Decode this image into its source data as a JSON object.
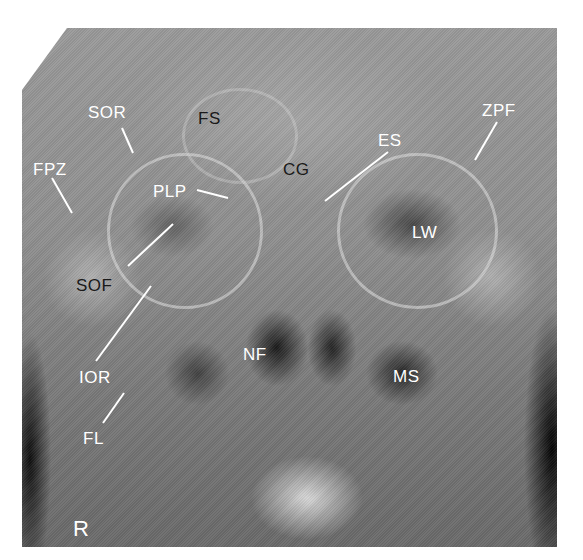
{
  "figure": {
    "type": "radiograph",
    "view": "frontal skull (Caldwell / PA projection)",
    "side_marker": "R"
  },
  "labels": [
    {
      "id": "SOR",
      "text": "SOR",
      "x": 88,
      "y": 104,
      "tone": "light"
    },
    {
      "id": "FS",
      "text": "FS",
      "x": 198,
      "y": 110,
      "tone": "dark"
    },
    {
      "id": "FPZ",
      "text": "FPZ",
      "x": 33,
      "y": 161,
      "tone": "light"
    },
    {
      "id": "CG",
      "text": "CG",
      "x": 283,
      "y": 161,
      "tone": "dark"
    },
    {
      "id": "ES",
      "text": "ES",
      "x": 378,
      "y": 132,
      "tone": "light"
    },
    {
      "id": "ZPF",
      "text": "ZPF",
      "x": 482,
      "y": 102,
      "tone": "light"
    },
    {
      "id": "PLP",
      "text": "PLP",
      "x": 153,
      "y": 183,
      "tone": "light"
    },
    {
      "id": "LW",
      "text": "LW",
      "x": 412,
      "y": 224,
      "tone": "light"
    },
    {
      "id": "SOF",
      "text": "SOF",
      "x": 76,
      "y": 277,
      "tone": "dark"
    },
    {
      "id": "IOR",
      "text": "IOR",
      "x": 79,
      "y": 369,
      "tone": "light"
    },
    {
      "id": "NF",
      "text": "NF",
      "x": 243,
      "y": 346,
      "tone": "light"
    },
    {
      "id": "MS",
      "text": "MS",
      "x": 393,
      "y": 368,
      "tone": "light"
    },
    {
      "id": "FL",
      "text": "FL",
      "x": 83,
      "y": 430,
      "tone": "light"
    }
  ],
  "leader_lines": [
    {
      "for": "SOR",
      "x1": 122,
      "y1": 128,
      "x2": 133,
      "y2": 153
    },
    {
      "for": "FPZ",
      "x1": 52,
      "y1": 178,
      "x2": 72,
      "y2": 213
    },
    {
      "for": "PLP",
      "x1": 197,
      "y1": 190,
      "x2": 228,
      "y2": 198
    },
    {
      "for": "ES",
      "x1": 388,
      "y1": 152,
      "x2": 325,
      "y2": 201
    },
    {
      "for": "ZPF",
      "x1": 497,
      "y1": 122,
      "x2": 475,
      "y2": 160
    },
    {
      "for": "SOF",
      "x1": 128,
      "y1": 266,
      "x2": 173,
      "y2": 224
    },
    {
      "for": "IOR",
      "x1": 96,
      "y1": 361,
      "x2": 151,
      "y2": 286
    },
    {
      "for": "FL",
      "x1": 103,
      "y1": 423,
      "x2": 124,
      "y2": 393
    }
  ],
  "colors": {
    "label_light": "#ffffff",
    "label_dark": "#1a1a1a",
    "leader": "#ffffff",
    "background": "#ffffff"
  }
}
